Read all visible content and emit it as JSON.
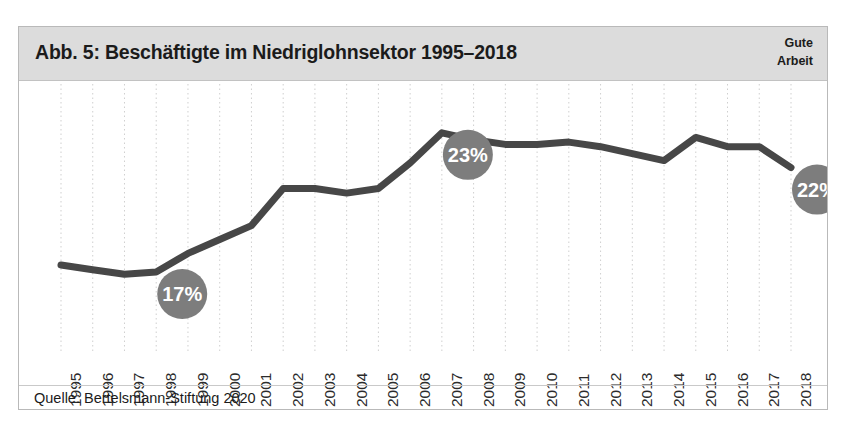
{
  "figure": {
    "title": "Abb. 5: Beschäftigte im Niedriglohnsektor 1995–2018",
    "brand_line1": "Gute",
    "brand_line2": "Arbeit",
    "source": "Quelle: Bertelsmann-Stiftung 2020",
    "colors": {
      "header_band": "#dcdcdc",
      "line": "#474747",
      "badge": "#7d7d7d",
      "badge_text": "#ffffff",
      "gridline": "#cfcfcf",
      "frame": "#b9b9b9",
      "text": "#1b1b1b"
    }
  },
  "chart_data": {
    "type": "line",
    "title": "Abb. 5: Beschäftigte im Niedriglohnsektor 1995–2018",
    "subtitle": "",
    "xlabel": "",
    "ylabel": "",
    "ylim": [
      14.5,
      24.5
    ],
    "grid": "vertical-dotted",
    "legend": "none",
    "axis_y_visible": false,
    "categories": [
      "1995",
      "1996",
      "1997",
      "1998",
      "1999",
      "2000",
      "2001",
      "2002",
      "2003",
      "2004",
      "2005",
      "2006",
      "2007",
      "2008",
      "2009",
      "2010",
      "2011",
      "2012",
      "2013",
      "2014",
      "2015",
      "2016",
      "2017",
      "2018"
    ],
    "series": [
      {
        "name": "Beschäftigte im Niedriglohnsektor",
        "unit": "%",
        "values": [
          17.3,
          17.1,
          16.9,
          17.0,
          17.8,
          18.4,
          19.0,
          20.6,
          20.6,
          20.4,
          20.6,
          21.7,
          23.0,
          22.7,
          22.5,
          22.5,
          22.6,
          22.4,
          22.1,
          21.8,
          22.8,
          22.4,
          22.4,
          21.5
        ]
      }
    ],
    "annotations": [
      {
        "year": "1998",
        "label": "17%",
        "value": 17.0
      },
      {
        "year": "2007",
        "label": "23%",
        "value": 23.0
      },
      {
        "year": "2018",
        "label": "22%",
        "value": 21.5
      }
    ]
  }
}
